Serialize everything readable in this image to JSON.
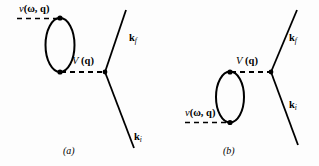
{
  "figure": {
    "background_color": "#fdfdfd",
    "line_color": "#000000"
  },
  "panels": [
    {
      "id": "a",
      "caption": "(a)",
      "labels": {
        "bare_interaction": "v (ω, q)",
        "bare_interaction_plain": "v",
        "bare_interaction_args": "(ω, q)",
        "screened_interaction": "V (q)",
        "screened_interaction_plain": "V",
        "screened_interaction_args": "(q)",
        "momentum_final": "k",
        "momentum_final_sub": "f",
        "momentum_initial": "k",
        "momentum_initial_sub": "i"
      }
    },
    {
      "id": "b",
      "caption": "(b)",
      "labels": {
        "bare_interaction": "v (ω, q)",
        "bare_interaction_plain": "v",
        "bare_interaction_args": "(ω, q)",
        "screened_interaction": "V (q)",
        "screened_interaction_plain": "V",
        "screened_interaction_args": "(q)",
        "momentum_final": "k",
        "momentum_final_sub": "f",
        "momentum_initial": "k",
        "momentum_initial_sub": "i"
      }
    }
  ]
}
